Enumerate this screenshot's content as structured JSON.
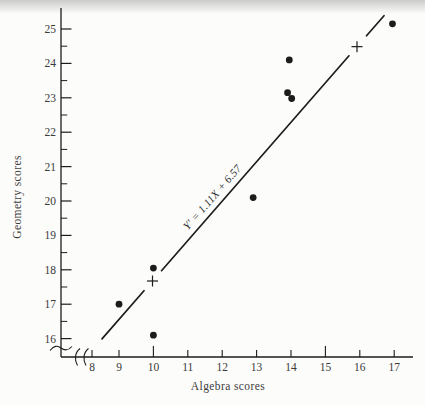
{
  "figure": {
    "background": "#fcfcfb",
    "ink_color": "#1c1c1c",
    "text_color": "#3a3a3a",
    "scan_band_color": "#c6c6c6"
  },
  "chart_data": {
    "type": "scatter",
    "title": "",
    "xlabel": "Algebra scores",
    "ylabel": "Geometry scores",
    "xlim": [
      8,
      17
    ],
    "ylim": [
      16,
      25
    ],
    "x_ticks": [
      8,
      9,
      10,
      11,
      12,
      13,
      14,
      15,
      16,
      17
    ],
    "x_emphasized_ticks": [
      10,
      15
    ],
    "y_ticks": [
      16,
      17,
      18,
      19,
      20,
      21,
      22,
      23,
      24,
      25
    ],
    "y_minor_tick_step": 0.5,
    "axis_break_x": true,
    "axis_break_y": true,
    "grid": false,
    "legend": null,
    "points": [
      [
        9,
        17
      ],
      [
        10,
        16
      ],
      [
        10,
        18
      ],
      [
        13,
        20
      ],
      [
        14,
        23
      ],
      [
        14,
        23
      ],
      [
        14,
        24
      ],
      [
        17,
        25
      ]
    ],
    "points_as_drawn": [
      [
        9,
        17.0
      ],
      [
        10,
        16.1
      ],
      [
        10,
        18.05
      ],
      [
        12.9,
        20.1
      ],
      [
        13.9,
        23.15
      ],
      [
        14.02,
        22.98
      ],
      [
        13.95,
        24.1
      ],
      [
        16.95,
        25.15
      ]
    ],
    "regression": {
      "equation_label": "Y′ = 1.11X + 6.57",
      "slope": 1.11,
      "intercept": 6.57,
      "marker_symbol": "+",
      "marker_points": [
        [
          10,
          17.67
        ],
        [
          16,
          24.33
        ]
      ],
      "line_x_range": [
        8.5,
        16.75
      ]
    }
  }
}
